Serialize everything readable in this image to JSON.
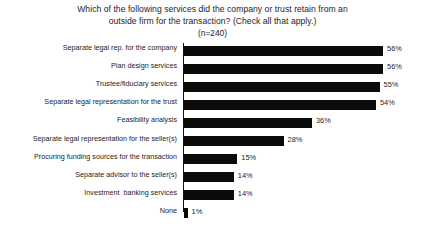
{
  "chart_data": {
    "type": "bar",
    "orientation": "horizontal",
    "title": "Which of the following services did the company or trust retain from an outside firm for the transaction? (Check all that apply.)",
    "title_lines": [
      "Which of the following services did the company or trust retain from an",
      "outside firm for the transaction? (Check all that apply.)"
    ],
    "subtitle": "(n=240)",
    "xlabel": "",
    "ylabel": "",
    "xlim": [
      0,
      60
    ],
    "grid": false,
    "legend": false,
    "value_suffix": "%",
    "bar_color": "#0b0b0b",
    "axis_color": "#111111",
    "background_color": "#ffffff",
    "categories": [
      "Separate legal rep. for the company",
      "Plan design services",
      "Trustee/fiduciary services",
      "Separate legal representation for the trust",
      "Feasibility analysis",
      "Separate legal representation for the seller(s)",
      "Procuring funding sources for the transaction",
      "Separate advisor to the seller(s)",
      "Investment  banking services",
      "None"
    ],
    "values": [
      56,
      56,
      55,
      54,
      36,
      28,
      15,
      14,
      14,
      1
    ],
    "value_labels": [
      "56%",
      "56%",
      "55%",
      "54%",
      "36%",
      "28%",
      "15%",
      "14%",
      "14%",
      "1%"
    ]
  }
}
